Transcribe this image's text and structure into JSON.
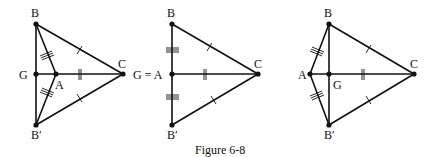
{
  "caption": "Figure 6-8",
  "figures": [
    {
      "id": "left",
      "labels": {
        "B": "B",
        "C": "C",
        "G": "G",
        "A": "A",
        "Bp": "B′"
      },
      "case": "A inside triangle BCB′ (A right of G)"
    },
    {
      "id": "middle",
      "labels": {
        "B": "B",
        "C": "C",
        "GA": "G = A",
        "Bp": "B′"
      },
      "case": "A coincides with G"
    },
    {
      "id": "right",
      "labels": {
        "B": "B",
        "C": "C",
        "G": "G",
        "A": "A",
        "Bp": "B′"
      },
      "case": "A outside (left of G)"
    }
  ],
  "tick_marks": {
    "BC_BpC": "single",
    "AC": "double",
    "AB_ABp": "triple"
  }
}
